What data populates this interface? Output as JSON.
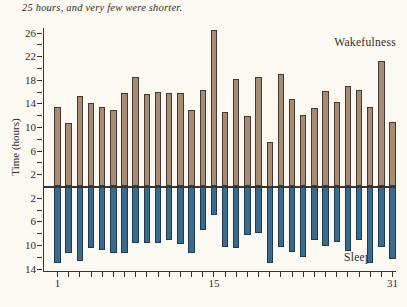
{
  "figure": {
    "caption_fragment": "25 hours, and very few were shorter.",
    "wake_label": "Wakefulness",
    "sleep_label": "Sleep",
    "y_axis_title": "Time (hours)"
  },
  "colors": {
    "background": "#fbf9f2",
    "wake_fill": "#a68c74",
    "wake_stroke": "#453830",
    "sleep_fill": "#3a6b8d",
    "sleep_stroke": "#1c3a50",
    "axis": "#37332c",
    "text": "#312d28"
  },
  "chart_data": {
    "type": "bar",
    "orientation": "diverging-vertical",
    "x": [
      1,
      2,
      3,
      4,
      5,
      6,
      7,
      8,
      9,
      10,
      11,
      12,
      13,
      14,
      15,
      16,
      17,
      18,
      19,
      20,
      21,
      22,
      23,
      24,
      25,
      26,
      27,
      28,
      29,
      30,
      31
    ],
    "series": [
      {
        "name": "Wakefulness",
        "direction": "up",
        "values": [
          13.4,
          10.8,
          15.4,
          14.2,
          13.4,
          12.9,
          15.8,
          18.6,
          15.7,
          16.0,
          15.9,
          15.9,
          12.9,
          16.3,
          26.5,
          12.7,
          18.3,
          11.9,
          18.6,
          7.5,
          19.0,
          14.8,
          12.2,
          13.3,
          16.2,
          14.4,
          17.0,
          16.4,
          13.5,
          21.3,
          10.9
        ]
      },
      {
        "name": "Sleep",
        "direction": "down",
        "values": [
          12.9,
          11.2,
          12.6,
          10.4,
          10.8,
          11.2,
          11.3,
          9.5,
          9.5,
          9.5,
          9.0,
          9.7,
          11.3,
          7.3,
          4.9,
          10.2,
          10.4,
          8.3,
          7.9,
          12.9,
          10.3,
          11.1,
          12.0,
          9.1,
          10.0,
          9.4,
          10.9,
          9.1,
          12.9,
          10.3,
          12.3
        ]
      }
    ],
    "ylabel": "Time (hours)",
    "y_tick_step": 2,
    "y_labeled_ticks_up": [
      2,
      6,
      10,
      14,
      18,
      22,
      26
    ],
    "y_labeled_ticks_down": [
      2,
      6,
      10,
      14
    ],
    "x_labeled_ticks": [
      1,
      15,
      31
    ],
    "ylim": [
      -14.5,
      27
    ],
    "grid": false,
    "legend_position": "wakefulness-top-right, sleep-bottom-right"
  }
}
